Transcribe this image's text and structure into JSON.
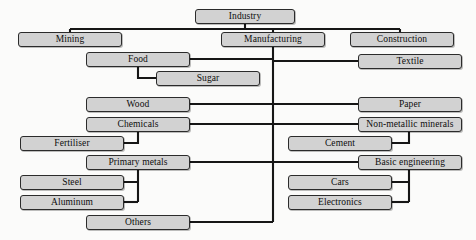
{
  "diagram": {
    "colors": {
      "node_fill": "#d2d2d2",
      "node_border": "#2b2b2b",
      "connector": "#161616",
      "background": "#fbfbfa",
      "text": "#0d0d0d"
    },
    "nodes": [
      {
        "id": "industry",
        "label": "Industry",
        "x": 195,
        "y": 9,
        "w": 100,
        "h": 15
      },
      {
        "id": "mining",
        "label": "Mining",
        "x": 18,
        "y": 32,
        "w": 104,
        "h": 15
      },
      {
        "id": "manufacturing",
        "label": "Manufacturing",
        "x": 221,
        "y": 32,
        "w": 104,
        "h": 15
      },
      {
        "id": "construction",
        "label": "Construction",
        "x": 350,
        "y": 32,
        "w": 104,
        "h": 15
      },
      {
        "id": "food",
        "label": "Food",
        "x": 86,
        "y": 52,
        "w": 104,
        "h": 15
      },
      {
        "id": "textile",
        "label": "Textile",
        "x": 358,
        "y": 54,
        "w": 104,
        "h": 15
      },
      {
        "id": "sugar",
        "label": "Sugar",
        "x": 156,
        "y": 71,
        "w": 104,
        "h": 15
      },
      {
        "id": "wood",
        "label": "Wood",
        "x": 86,
        "y": 97,
        "w": 104,
        "h": 15
      },
      {
        "id": "paper",
        "label": "Paper",
        "x": 358,
        "y": 97,
        "w": 104,
        "h": 15
      },
      {
        "id": "chemicals",
        "label": "Chemicals",
        "x": 86,
        "y": 117,
        "w": 104,
        "h": 15
      },
      {
        "id": "non_metallic",
        "label": "Non-metallic minerals",
        "x": 358,
        "y": 117,
        "w": 104,
        "h": 15
      },
      {
        "id": "fertiliser",
        "label": "Fertiliser",
        "x": 20,
        "y": 136,
        "w": 104,
        "h": 15
      },
      {
        "id": "cement",
        "label": "Cement",
        "x": 288,
        "y": 136,
        "w": 104,
        "h": 15
      },
      {
        "id": "primary_metals",
        "label": "Primary metals",
        "x": 86,
        "y": 155,
        "w": 104,
        "h": 15
      },
      {
        "id": "basic_engineering",
        "label": "Basic engineering",
        "x": 358,
        "y": 155,
        "w": 104,
        "h": 15
      },
      {
        "id": "steel",
        "label": "Steel",
        "x": 20,
        "y": 175,
        "w": 104,
        "h": 15
      },
      {
        "id": "cars",
        "label": "Cars",
        "x": 288,
        "y": 175,
        "w": 104,
        "h": 15
      },
      {
        "id": "aluminum",
        "label": "Aluminum",
        "x": 20,
        "y": 195,
        "w": 104,
        "h": 15
      },
      {
        "id": "electronics",
        "label": "Electronics",
        "x": 288,
        "y": 195,
        "w": 104,
        "h": 15
      },
      {
        "id": "others",
        "label": "Others",
        "x": 86,
        "y": 215,
        "w": 104,
        "h": 15
      }
    ],
    "edges": [
      {
        "from": "industry",
        "to": "mining",
        "path": "M245,24 L245,29 M70,29 L400,29 M70,29 L70,32"
      },
      {
        "from": "industry",
        "to": "manufacturing",
        "path": "M273,29 L273,32"
      },
      {
        "from": "industry",
        "to": "construction",
        "path": "M400,29 L400,32"
      },
      {
        "from": "manufacturing",
        "to": "trunk",
        "path": "M273,47 L273,222"
      },
      {
        "from": "trunk",
        "to": "food",
        "path": "M273,59 L190,59"
      },
      {
        "from": "trunk",
        "to": "textile",
        "path": "M273,61 L358,61"
      },
      {
        "from": "food",
        "to": "sugar",
        "path": "M138,67 L138,78 L156,78"
      },
      {
        "from": "trunk",
        "to": "wood",
        "path": "M273,104 L190,104"
      },
      {
        "from": "trunk",
        "to": "paper",
        "path": "M273,104 L358,104"
      },
      {
        "from": "trunk",
        "to": "chemicals",
        "path": "M273,124 L190,124"
      },
      {
        "from": "trunk",
        "to": "non_metallic",
        "path": "M273,124 L358,124"
      },
      {
        "from": "chemicals",
        "to": "fertiliser",
        "path": "M138,132 L138,143 L124,143"
      },
      {
        "from": "non_metallic",
        "to": "cement",
        "path": "M409,132 L409,143 L392,143"
      },
      {
        "from": "trunk",
        "to": "primary_metals",
        "path": "M273,162 L190,162"
      },
      {
        "from": "trunk",
        "to": "basic_engineering",
        "path": "M273,162 L358,162"
      },
      {
        "from": "primary_metals",
        "to": "steel",
        "path": "M138,170 L138,202 M138,182 L124,182"
      },
      {
        "from": "primary_metals",
        "to": "aluminum",
        "path": "M138,202 L124,202"
      },
      {
        "from": "basic_engineering",
        "to": "cars",
        "path": "M409,170 L409,202 M409,182 L392,182"
      },
      {
        "from": "basic_engineering",
        "to": "electronics",
        "path": "M409,202 L392,202"
      },
      {
        "from": "trunk",
        "to": "others",
        "path": "M273,222 L190,222"
      }
    ]
  }
}
